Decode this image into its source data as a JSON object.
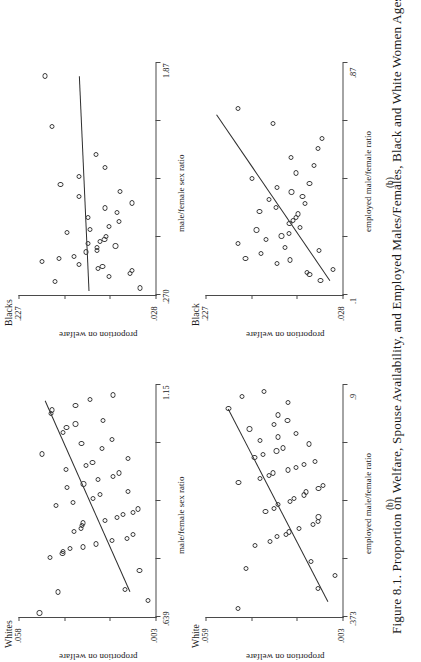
{
  "figure": {
    "caption": "Figure 8.1. Proportion on Welfare, Spouse Availability, and Employed Males/Females, Black and White Women Ages Sixteen",
    "ylabel": "proportion on welfare"
  },
  "chart_data": [
    {
      "type": "scatter",
      "panel": "a",
      "sublabel": "(a)",
      "title": "Whites",
      "xlabel": "male/female sex ratio",
      "ylabel": "proportion on welfare",
      "xlim": [
        0.639,
        1.15
      ],
      "ylim": [
        0.003,
        0.058
      ],
      "xticklabels": [
        ".639",
        "1.15"
      ],
      "yticklabels": [
        ".003",
        ".058"
      ],
      "grid": false,
      "legend": "none",
      "trendline": {
        "x0": 0.695,
        "y0": 0.0135,
        "x1": 1.115,
        "y1": 0.0475
      },
      "points": [
        {
          "x": 0.648,
          "y": 0.0496
        },
        {
          "x": 0.694,
          "y": 0.0423
        },
        {
          "x": 0.676,
          "y": 0.006
        },
        {
          "x": 0.7,
          "y": 0.0152
        },
        {
          "x": 0.742,
          "y": 0.0094
        },
        {
          "x": 0.77,
          "y": 0.0455
        },
        {
          "x": 0.779,
          "y": 0.0403
        },
        {
          "x": 0.784,
          "y": 0.04
        },
        {
          "x": 0.789,
          "y": 0.0374
        },
        {
          "x": 0.793,
          "y": 0.0322
        },
        {
          "x": 0.8,
          "y": 0.0268
        },
        {
          "x": 0.808,
          "y": 0.0203
        },
        {
          "x": 0.812,
          "y": 0.0146
        },
        {
          "x": 0.82,
          "y": 0.012
        },
        {
          "x": 0.828,
          "y": 0.0358
        },
        {
          "x": 0.834,
          "y": 0.033
        },
        {
          "x": 0.84,
          "y": 0.0325
        },
        {
          "x": 0.846,
          "y": 0.032
        },
        {
          "x": 0.852,
          "y": 0.0232
        },
        {
          "x": 0.858,
          "y": 0.0186
        },
        {
          "x": 0.864,
          "y": 0.016
        },
        {
          "x": 0.87,
          "y": 0.0119
        },
        {
          "x": 0.877,
          "y": 0.01
        },
        {
          "x": 0.884,
          "y": 0.043
        },
        {
          "x": 0.892,
          "y": 0.036
        },
        {
          "x": 0.9,
          "y": 0.0282
        },
        {
          "x": 0.908,
          "y": 0.0253
        },
        {
          "x": 0.916,
          "y": 0.014
        },
        {
          "x": 0.924,
          "y": 0.0386
        },
        {
          "x": 0.932,
          "y": 0.0319
        },
        {
          "x": 0.941,
          "y": 0.0262
        },
        {
          "x": 0.948,
          "y": 0.02
        },
        {
          "x": 0.956,
          "y": 0.0175
        },
        {
          "x": 0.964,
          "y": 0.039
        },
        {
          "x": 0.972,
          "y": 0.0308
        },
        {
          "x": 0.98,
          "y": 0.0283
        },
        {
          "x": 0.988,
          "y": 0.014
        },
        {
          "x": 0.998,
          "y": 0.0486
        },
        {
          "x": 1.01,
          "y": 0.0246
        },
        {
          "x": 1.021,
          "y": 0.0327
        },
        {
          "x": 1.03,
          "y": 0.0205
        },
        {
          "x": 1.045,
          "y": 0.04
        },
        {
          "x": 1.056,
          "y": 0.0387
        },
        {
          "x": 1.064,
          "y": 0.0351
        },
        {
          "x": 1.072,
          "y": 0.0241
        },
        {
          "x": 1.088,
          "y": 0.0448
        },
        {
          "x": 1.095,
          "y": 0.0444
        },
        {
          "x": 1.104,
          "y": 0.0351
        },
        {
          "x": 1.118,
          "y": 0.0294
        },
        {
          "x": 1.128,
          "y": 0.0199
        }
      ]
    },
    {
      "type": "scatter",
      "panel": "b",
      "sublabel": "(b)",
      "title": "White",
      "xlabel": "employed male/female ratio",
      "ylabel": "proportion on welfare",
      "xlim": [
        0.373,
        0.9
      ],
      "ylim": [
        0.003,
        0.059
      ],
      "xticklabels": [
        ".373",
        ".9"
      ],
      "yticklabels": [
        ".003",
        ".059"
      ],
      "grid": false,
      "legend": "none",
      "trendline": {
        "x0": 0.408,
        "y0": 0.009,
        "x1": 0.845,
        "y1": 0.0497
      },
      "points": [
        {
          "x": 0.392,
          "y": 0.0456
        },
        {
          "x": 0.437,
          "y": 0.0131
        },
        {
          "x": 0.468,
          "y": 0.006
        },
        {
          "x": 0.483,
          "y": 0.0425
        },
        {
          "x": 0.499,
          "y": 0.0159
        },
        {
          "x": 0.536,
          "y": 0.0389
        },
        {
          "x": 0.545,
          "y": 0.0327
        },
        {
          "x": 0.555,
          "y": 0.0299
        },
        {
          "x": 0.56,
          "y": 0.0261
        },
        {
          "x": 0.566,
          "y": 0.025
        },
        {
          "x": 0.574,
          "y": 0.0209
        },
        {
          "x": 0.583,
          "y": 0.0152
        },
        {
          "x": 0.59,
          "y": 0.013
        },
        {
          "x": 0.6,
          "y": 0.0128
        },
        {
          "x": 0.613,
          "y": 0.0345
        },
        {
          "x": 0.62,
          "y": 0.031
        },
        {
          "x": 0.628,
          "y": 0.0292
        },
        {
          "x": 0.636,
          "y": 0.0246
        },
        {
          "x": 0.643,
          "y": 0.0229
        },
        {
          "x": 0.65,
          "y": 0.0189
        },
        {
          "x": 0.657,
          "y": 0.018
        },
        {
          "x": 0.664,
          "y": 0.0128
        },
        {
          "x": 0.672,
          "y": 0.011
        },
        {
          "x": 0.679,
          "y": 0.0455
        },
        {
          "x": 0.687,
          "y": 0.0366
        },
        {
          "x": 0.694,
          "y": 0.0331
        },
        {
          "x": 0.7,
          "y": 0.0314
        },
        {
          "x": 0.707,
          "y": 0.0253
        },
        {
          "x": 0.713,
          "y": 0.0221
        },
        {
          "x": 0.72,
          "y": 0.0188
        },
        {
          "x": 0.727,
          "y": 0.0144
        },
        {
          "x": 0.735,
          "y": 0.039
        },
        {
          "x": 0.742,
          "y": 0.0354
        },
        {
          "x": 0.75,
          "y": 0.03
        },
        {
          "x": 0.757,
          "y": 0.0273
        },
        {
          "x": 0.766,
          "y": 0.0166
        },
        {
          "x": 0.774,
          "y": 0.0366
        },
        {
          "x": 0.782,
          "y": 0.0294
        },
        {
          "x": 0.79,
          "y": 0.0219
        },
        {
          "x": 0.8,
          "y": 0.041
        },
        {
          "x": 0.81,
          "y": 0.031
        },
        {
          "x": 0.82,
          "y": 0.0255
        },
        {
          "x": 0.832,
          "y": 0.0293
        },
        {
          "x": 0.846,
          "y": 0.0496
        },
        {
          "x": 0.86,
          "y": 0.0253
        },
        {
          "x": 0.873,
          "y": 0.044
        },
        {
          "x": 0.886,
          "y": 0.035
        }
      ]
    },
    {
      "type": "scatter",
      "panel": "c",
      "sublabel": "(a)",
      "title": "Blacks",
      "xlabel": "male/female sex ratio",
      "ylabel": "proportion on welfare",
      "xlim": [
        0.27,
        1.87
      ],
      "ylim": [
        0.028,
        0.227
      ],
      "xticklabels": [
        ".270",
        "1.87"
      ],
      "yticklabels": [
        ".028",
        ".227"
      ],
      "grid": false,
      "legend": "none",
      "trendline": {
        "x0": 0.3,
        "y0": 0.125,
        "x1": 1.78,
        "y1": 0.139
      },
      "points": [
        {
          "x": 0.318,
          "y": 0.051
        },
        {
          "x": 0.364,
          "y": 0.1735
        },
        {
          "x": 0.4,
          "y": 0.095
        },
        {
          "x": 0.42,
          "y": 0.065
        },
        {
          "x": 0.438,
          "y": 0.062
        },
        {
          "x": 0.455,
          "y": 0.111
        },
        {
          "x": 0.466,
          "y": 0.105
        },
        {
          "x": 0.48,
          "y": 0.139
        },
        {
          "x": 0.503,
          "y": 0.193
        },
        {
          "x": 0.52,
          "y": 0.168
        },
        {
          "x": 0.537,
          "y": 0.1465
        },
        {
          "x": 0.566,
          "y": 0.1285
        },
        {
          "x": 0.578,
          "y": 0.1135
        },
        {
          "x": 0.595,
          "y": 0.113
        },
        {
          "x": 0.608,
          "y": 0.086
        },
        {
          "x": 0.628,
          "y": 0.1255
        },
        {
          "x": 0.64,
          "y": 0.109
        },
        {
          "x": 0.655,
          "y": 0.102
        },
        {
          "x": 0.672,
          "y": 0.1
        },
        {
          "x": 0.7,
          "y": 0.156
        },
        {
          "x": 0.72,
          "y": 0.123
        },
        {
          "x": 0.745,
          "y": 0.0955
        },
        {
          "x": 0.775,
          "y": 0.0815
        },
        {
          "x": 0.805,
          "y": 0.1255
        },
        {
          "x": 0.84,
          "y": 0.084
        },
        {
          "x": 0.87,
          "y": 0.101
        },
        {
          "x": 0.905,
          "y": 0.0625
        },
        {
          "x": 0.95,
          "y": 0.139
        },
        {
          "x": 0.985,
          "y": 0.079
        },
        {
          "x": 1.03,
          "y": 0.166
        },
        {
          "x": 1.09,
          "y": 0.1395
        },
        {
          "x": 1.15,
          "y": 0.1015
        },
        {
          "x": 1.24,
          "y": 0.114
        },
        {
          "x": 1.43,
          "y": 0.1785
        },
        {
          "x": 1.78,
          "y": 0.188
        }
      ]
    },
    {
      "type": "scatter",
      "panel": "d",
      "sublabel": "(b)",
      "title": "Black",
      "xlabel": "employed male/female ratio",
      "ylabel": "proportion on welfare",
      "xlim": [
        0.1,
        0.87
      ],
      "ylim": [
        0.028,
        0.227
      ],
      "xticklabels": [
        ".1",
        ".87"
      ],
      "yticklabels": [
        ".028",
        ".227"
      ],
      "grid": false,
      "legend": "none",
      "trendline": {
        "x0": 0.148,
        "y0": 0.047,
        "x1": 0.7,
        "y1": 0.212
      },
      "points": [
        {
          "x": 0.148,
          "y": 0.06
        },
        {
          "x": 0.168,
          "y": 0.076
        },
        {
          "x": 0.176,
          "y": 0.079
        },
        {
          "x": 0.185,
          "y": 0.042
        },
        {
          "x": 0.204,
          "y": 0.123
        },
        {
          "x": 0.216,
          "y": 0.104
        },
        {
          "x": 0.222,
          "y": 0.169
        },
        {
          "x": 0.238,
          "y": 0.146
        },
        {
          "x": 0.248,
          "y": 0.062
        },
        {
          "x": 0.258,
          "y": 0.112
        },
        {
          "x": 0.27,
          "y": 0.18
        },
        {
          "x": 0.285,
          "y": 0.1395
        },
        {
          "x": 0.296,
          "y": 0.1165
        },
        {
          "x": 0.304,
          "y": 0.1055
        },
        {
          "x": 0.316,
          "y": 0.153
        },
        {
          "x": 0.325,
          "y": 0.09
        },
        {
          "x": 0.336,
          "y": 0.105
        },
        {
          "x": 0.348,
          "y": 0.1
        },
        {
          "x": 0.358,
          "y": 0.0955
        },
        {
          "x": 0.369,
          "y": 0.0925
        },
        {
          "x": 0.378,
          "y": 0.1485
        },
        {
          "x": 0.391,
          "y": 0.124
        },
        {
          "x": 0.404,
          "y": 0.082
        },
        {
          "x": 0.417,
          "y": 0.1345
        },
        {
          "x": 0.428,
          "y": 0.086
        },
        {
          "x": 0.442,
          "y": 0.102
        },
        {
          "x": 0.456,
          "y": 0.1235
        },
        {
          "x": 0.47,
          "y": 0.076
        },
        {
          "x": 0.488,
          "y": 0.16
        },
        {
          "x": 0.505,
          "y": 0.095
        },
        {
          "x": 0.53,
          "y": 0.069
        },
        {
          "x": 0.556,
          "y": 0.1025
        },
        {
          "x": 0.585,
          "y": 0.0635
        },
        {
          "x": 0.62,
          "y": 0.058
        },
        {
          "x": 0.67,
          "y": 0.1295
        },
        {
          "x": 0.72,
          "y": 0.18
        }
      ]
    }
  ]
}
